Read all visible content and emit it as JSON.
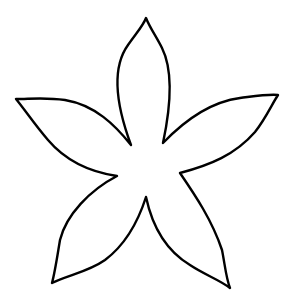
{
  "figure": {
    "background": "#ffffff",
    "stroke": "#000000",
    "stroke_width": 2.4,
    "petals": [
      {
        "name": "top",
        "tip": [
          146,
          18
        ]
      },
      {
        "name": "left",
        "tip": [
          16,
          99
        ]
      },
      {
        "name": "right",
        "tip": [
          278,
          95
        ]
      },
      {
        "name": "bottom-left",
        "tip": [
          52,
          283
        ]
      },
      {
        "name": "bottom-right",
        "tip": [
          230,
          288
        ]
      }
    ],
    "valleys": [
      [
        131,
        145
      ],
      [
        163,
        143
      ],
      [
        180,
        173
      ],
      [
        146,
        197
      ],
      [
        117,
        176
      ]
    ]
  }
}
